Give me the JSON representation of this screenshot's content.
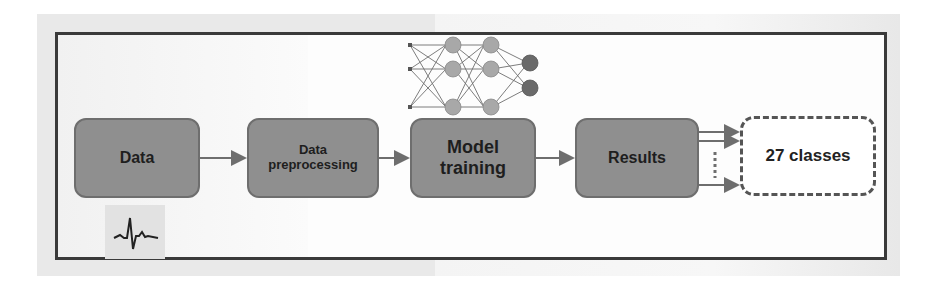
{
  "diagram": {
    "type": "pipeline-flowchart",
    "nodes": [
      {
        "id": "data",
        "label": "Data"
      },
      {
        "id": "preprocessing",
        "label_line1": "Data",
        "label_line2": "preprocessing"
      },
      {
        "id": "model",
        "label_line1": "Model",
        "label_line2": "training"
      },
      {
        "id": "results",
        "label": "Results"
      },
      {
        "id": "classes",
        "label": "27 classes"
      }
    ],
    "edges": [
      {
        "from": "data",
        "to": "preprocessing"
      },
      {
        "from": "preprocessing",
        "to": "model"
      },
      {
        "from": "model",
        "to": "results"
      },
      {
        "from": "results",
        "to": "classes",
        "multiple": true
      }
    ],
    "icons": {
      "data_icon": "ecg-waveform-icon",
      "model_icon": "neural-network-icon"
    },
    "colors": {
      "box_fill": "#8f8f8f",
      "box_border": "#6e6e6e",
      "frame": "#3a3a3a",
      "nn_hidden_node": "#a8a8a8",
      "nn_output_node": "#6a6a6a",
      "text": "#1e1e1e"
    }
  }
}
